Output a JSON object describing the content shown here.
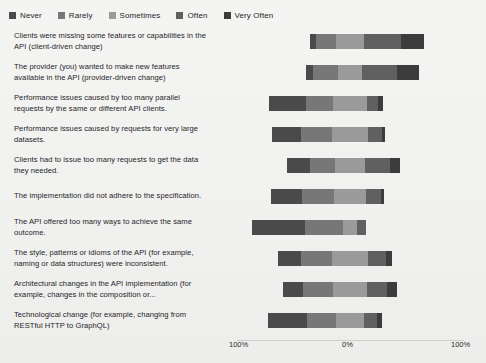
{
  "chart_data": {
    "type": "bar",
    "subtype": "diverging-stacked-likert",
    "title": "",
    "xlabel": "",
    "ylabel": "",
    "grid": false,
    "legend_position": "top-left",
    "xlim": [
      -100,
      100
    ],
    "xticks": [
      "100%",
      "0%",
      "100%"
    ],
    "xtick_values": [
      -100,
      0,
      100
    ],
    "categories": [
      "Clients were missing some features or capabilities in the API (client-driven change)",
      "The provider (you) wanted to make new features available in the API (provider-driven change)",
      "Performance issues caused by too many parallel requests by the same or different API clients.",
      "Performance issues caused by requests for very large datasets.",
      "Clients had to issue too many requests to get the data they needed.",
      "The implementation did not adhere to the specification.",
      "The API offered too many ways to achieve the same outcome.",
      "The style, patterns or idioms of the API (for example, naming or data structures) were inconsistent.",
      "Architectural changes in the API implementation (for example, changes in the composition or...",
      "Technological change (for example, changing from RESTful HTTP to GraphQL)"
    ],
    "series": [
      {
        "name": "Never",
        "color": "#4a4a4a",
        "values": [
          5,
          6,
          32,
          26,
          20,
          28,
          46,
          20,
          18,
          34
        ]
      },
      {
        "name": "Rarely",
        "color": "#777777",
        "values": [
          18,
          22,
          24,
          27,
          22,
          28,
          34,
          27,
          26,
          26
        ]
      },
      {
        "name": "Sometimes",
        "color": "#9a9a9a",
        "values": [
          24,
          22,
          30,
          32,
          27,
          28,
          12,
          32,
          30,
          24
        ]
      },
      {
        "name": "Often",
        "color": "#606060",
        "values": [
          33,
          30,
          10,
          12,
          22,
          13,
          8,
          16,
          18,
          12
        ]
      },
      {
        "name": "Very Often",
        "color": "#3c3c3c",
        "values": [
          20,
          20,
          4,
          3,
          9,
          3,
          0,
          5,
          8,
          4
        ]
      }
    ]
  },
  "legend": {
    "items": [
      {
        "label": "Never",
        "color": "#4a4a4a"
      },
      {
        "label": "Rarely",
        "color": "#777777"
      },
      {
        "label": "Sometimes",
        "color": "#9a9a9a"
      },
      {
        "label": "Often",
        "color": "#606060"
      },
      {
        "label": "Very Often",
        "color": "#3c3c3c"
      }
    ]
  },
  "axis": {
    "left_tick": "100%",
    "mid_tick": "0%",
    "right_tick": "100%"
  }
}
